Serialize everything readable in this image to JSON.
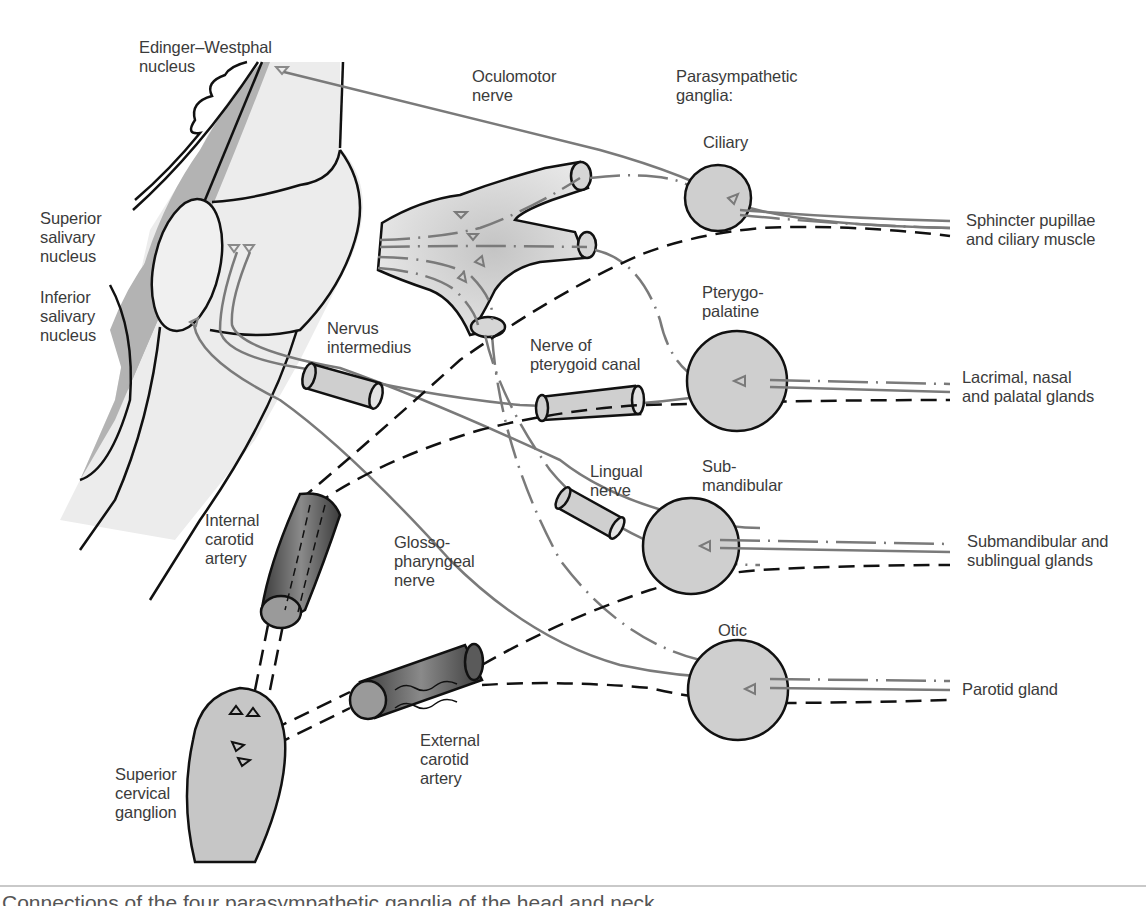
{
  "figure": {
    "caption": "Connections of the four parasympathetic ganglia of the head and neck",
    "colors": {
      "brainstem_fill": "#ececec",
      "brainstem_shadow": "#b3b3b3",
      "ganglion_fill": "#cfcfcf",
      "artery_fill": "#5a5a5a",
      "nerve_gray": "#7a7a7a",
      "outline": "#111111",
      "sympathetic_dash": "#111111"
    },
    "labels": {
      "edinger_westphal": "Edinger–Westphal\nnucleus",
      "oculomotor_nerve": "Oculomotor\nnerve",
      "parasympathetic_ganglia": "Parasympathetic\nganglia:",
      "superior_salivary": "Superior\nsalivary\nnucleus",
      "inferior_salivary": "Inferior\nsalivary\nnucleus",
      "nervus_intermedius": "Nervus\nintermedius",
      "nerve_pterygoid_canal": "Nerve of\npterygoid canal",
      "lingual_nerve": "Lingual\nnerve",
      "internal_carotid": "Internal\ncarotid\nartery",
      "glossopharyngeal": "Glosso-\npharyngeal\nnerve",
      "external_carotid": "External\ncarotid\nartery",
      "superior_cervical": "Superior\ncervical\nganglion"
    },
    "ganglia": [
      {
        "name": "Ciliary",
        "target": "Sphincter pupillae\nand ciliary muscle"
      },
      {
        "name": "Pterygo-\npalatine",
        "target": "Lacrimal, nasal\nand palatal glands"
      },
      {
        "name": "Sub-\nmandibular",
        "target": "Submandibular and\nsublingual glands"
      },
      {
        "name": "Otic",
        "target": "Parotid gland"
      }
    ]
  }
}
